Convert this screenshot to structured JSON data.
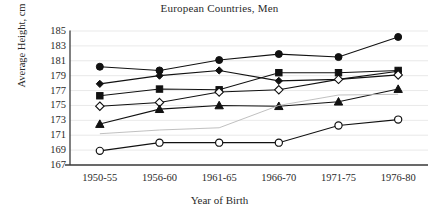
{
  "chart_data": {
    "type": "line",
    "title": "European Countries, Men",
    "xlabel": "Year of Birth",
    "ylabel": "Average Height, cm",
    "categories": [
      "1950-55",
      "1956-60",
      "1961-65",
      "1966-70",
      "1971-75",
      "1976-80"
    ],
    "ylim": [
      167,
      185
    ],
    "ytick_step": 2,
    "yticks": [
      185,
      183,
      181,
      179,
      177,
      175,
      173,
      171,
      169,
      167
    ],
    "grid": true,
    "legend": "none",
    "series": [
      {
        "name": "series-filled-circle",
        "marker": "filled-circle",
        "color": "#111111",
        "values": [
          180.2,
          179.7,
          181.1,
          181.9,
          181.5,
          184.2
        ]
      },
      {
        "name": "series-filled-diamond",
        "marker": "filled-diamond",
        "color": "#111111",
        "values": [
          177.9,
          179.0,
          179.7,
          178.3,
          178.5,
          179.6
        ]
      },
      {
        "name": "series-filled-square",
        "marker": "filled-square",
        "color": "#111111",
        "values": [
          176.3,
          177.2,
          177.1,
          179.4,
          179.4,
          179.7
        ]
      },
      {
        "name": "series-open-diamond",
        "marker": "open-diamond",
        "color": "#111111",
        "values": [
          174.9,
          175.4,
          176.8,
          177.1,
          178.5,
          179.1
        ]
      },
      {
        "name": "series-filled-triangle",
        "marker": "filled-triangle",
        "color": "#111111",
        "values": [
          172.5,
          174.5,
          175.0,
          174.9,
          175.5,
          177.2
        ]
      },
      {
        "name": "series-open-circle",
        "marker": "open-circle",
        "color": "#111111",
        "values": [
          168.9,
          170.0,
          170.0,
          170.0,
          172.3,
          173.1
        ]
      },
      {
        "name": "series-faint-line",
        "marker": "none",
        "color": "#b9b9b9",
        "values": [
          171.2,
          171.7,
          172.0,
          175.0,
          176.4,
          176.5
        ]
      }
    ]
  }
}
